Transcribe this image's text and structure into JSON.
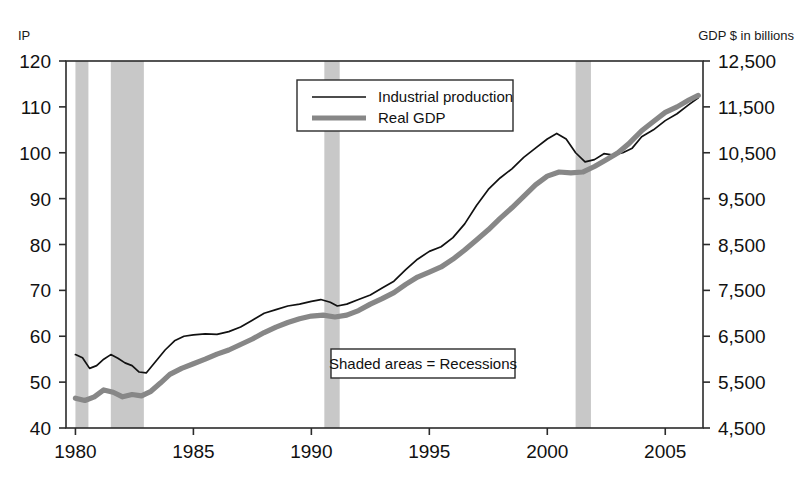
{
  "chart_data": {
    "type": "line",
    "title": "",
    "xlabel": "",
    "ylabel": "IP",
    "y2label": "GDP $ in billions",
    "grid": false,
    "legend_position": "top-center",
    "xlim": [
      1979.6,
      2006.6
    ],
    "ylim": [
      40,
      120
    ],
    "y2lim": [
      4500,
      12500
    ],
    "xticks": [
      1980,
      1985,
      1990,
      1995,
      2000,
      2005
    ],
    "xtick_labels": [
      "1980",
      "1985",
      "1990",
      "1995",
      "2000",
      "2005"
    ],
    "yticks": [
      40,
      50,
      60,
      70,
      80,
      90,
      100,
      110,
      120
    ],
    "ytick_labels": [
      "40",
      "50",
      "60",
      "70",
      "80",
      "90",
      "100",
      "110",
      "120"
    ],
    "y2ticks": [
      4500,
      5500,
      6500,
      7500,
      8500,
      9500,
      10500,
      11500,
      12500
    ],
    "y2tick_labels": [
      "4,500",
      "5,500",
      "6,500",
      "7,500",
      "8,500",
      "9,500",
      "10,500",
      "11,500",
      "12,500"
    ],
    "annotation": "Shaded areas = Recessions",
    "shaded_bands_label": "Recessions",
    "shaded_bands": [
      {
        "start": 1980.0,
        "end": 1980.55
      },
      {
        "start": 1981.5,
        "end": 1982.9
      },
      {
        "start": 1990.55,
        "end": 1991.2
      },
      {
        "start": 2001.2,
        "end": 2001.85
      }
    ],
    "series": [
      {
        "name": "Industrial production",
        "axis": "left",
        "color": "#111111",
        "style": "thin-line",
        "x": [
          1980.0,
          1980.3,
          1980.6,
          1980.9,
          1981.2,
          1981.5,
          1981.8,
          1982.1,
          1982.4,
          1982.7,
          1983.0,
          1983.4,
          1983.8,
          1984.2,
          1984.6,
          1985.0,
          1985.5,
          1986.0,
          1986.5,
          1987.0,
          1987.5,
          1988.0,
          1988.5,
          1989.0,
          1989.5,
          1990.0,
          1990.4,
          1990.8,
          1991.1,
          1991.5,
          1992.0,
          1992.5,
          1993.0,
          1993.5,
          1994.0,
          1994.5,
          1995.0,
          1995.5,
          1996.0,
          1996.5,
          1997.0,
          1997.5,
          1998.0,
          1998.5,
          1999.0,
          1999.5,
          2000.0,
          2000.4,
          2000.8,
          2001.2,
          2001.6,
          2002.0,
          2002.4,
          2002.8,
          2003.2,
          2003.6,
          2004.0,
          2004.5,
          2005.0,
          2005.5,
          2006.0,
          2006.4
        ],
        "y": [
          56.0,
          55.3,
          53.0,
          53.6,
          55.0,
          56.0,
          55.2,
          54.2,
          53.6,
          52.2,
          52.0,
          54.5,
          57.0,
          59.0,
          60.0,
          60.3,
          60.5,
          60.4,
          61.0,
          62.0,
          63.5,
          65.0,
          65.8,
          66.6,
          67.0,
          67.6,
          68.0,
          67.4,
          66.6,
          67.0,
          68.0,
          69.0,
          70.5,
          72.0,
          74.5,
          76.8,
          78.5,
          79.5,
          81.5,
          84.5,
          88.5,
          92.0,
          94.5,
          96.5,
          99.0,
          101.0,
          103.0,
          104.2,
          103.0,
          100.0,
          98.0,
          98.5,
          99.8,
          99.5,
          100.0,
          101.0,
          103.5,
          105.0,
          107.0,
          108.5,
          110.5,
          112.0
        ]
      },
      {
        "name": "Real GDP",
        "axis": "right",
        "color": "#878787",
        "style": "thick-line",
        "x": [
          1980.0,
          1980.4,
          1980.8,
          1981.2,
          1981.6,
          1982.0,
          1982.4,
          1982.8,
          1983.2,
          1983.6,
          1984.0,
          1984.5,
          1985.0,
          1985.5,
          1986.0,
          1986.5,
          1987.0,
          1987.5,
          1988.0,
          1988.5,
          1989.0,
          1989.5,
          1990.0,
          1990.5,
          1991.0,
          1991.5,
          1992.0,
          1992.5,
          1993.0,
          1993.5,
          1994.0,
          1994.5,
          1995.0,
          1995.5,
          1996.0,
          1996.5,
          1997.0,
          1997.5,
          1998.0,
          1998.5,
          1999.0,
          1999.5,
          2000.0,
          2000.5,
          2001.0,
          2001.5,
          2002.0,
          2002.5,
          2003.0,
          2003.5,
          2004.0,
          2004.5,
          2005.0,
          2005.5,
          2006.0,
          2006.4
        ],
        "y": [
          5150,
          5100,
          5180,
          5330,
          5280,
          5180,
          5230,
          5200,
          5300,
          5480,
          5670,
          5800,
          5900,
          6000,
          6110,
          6200,
          6320,
          6440,
          6580,
          6700,
          6800,
          6880,
          6940,
          6960,
          6920,
          6960,
          7060,
          7200,
          7320,
          7450,
          7630,
          7790,
          7900,
          8010,
          8180,
          8380,
          8600,
          8820,
          9070,
          9300,
          9550,
          9800,
          9990,
          10080,
          10060,
          10080,
          10200,
          10350,
          10500,
          10720,
          10980,
          11180,
          11380,
          11500,
          11650,
          11750
        ]
      }
    ]
  },
  "legend": {
    "items": [
      {
        "label": "Industrial production",
        "style": "thin-line"
      },
      {
        "label": "Real GDP",
        "style": "thick-line"
      }
    ]
  },
  "labels": {
    "left_axis_title": "IP",
    "right_axis_title": "GDP $ in billions",
    "annotation": "Shaded areas = Recessions"
  },
  "colors": {
    "ip_line": "#111111",
    "gdp_line": "#878787",
    "recession_band": "#c8c8c8",
    "frame": "#2b2b2b",
    "background": "#ffffff"
  }
}
